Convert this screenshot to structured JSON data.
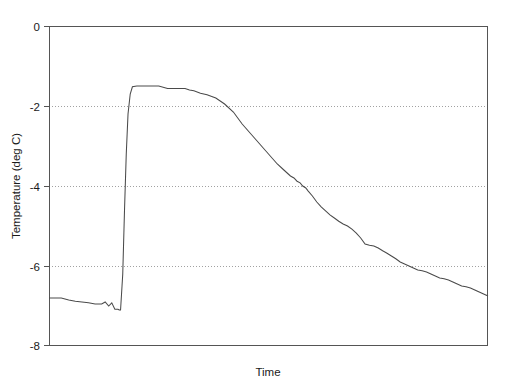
{
  "chart_data": {
    "type": "line",
    "title": "",
    "xlabel": "Time",
    "ylabel": "Temperature (deg C)",
    "ylim": [
      -8,
      0
    ],
    "yticks": [
      0,
      -2,
      -4,
      -6,
      -8
    ],
    "ytick_labels": [
      "0",
      "-2",
      "-4",
      "-6",
      "-8"
    ],
    "xticks": [],
    "xtick_labels": [],
    "grid": "horizontal-dotted-at--2--4--6",
    "legend": "none",
    "series": [
      {
        "name": "Temperature",
        "line_color": "#4a4a4a",
        "x": [
          0.0,
          0.028,
          0.045,
          0.06,
          0.075,
          0.09,
          0.105,
          0.12,
          0.128,
          0.136,
          0.143,
          0.15,
          0.157,
          0.16,
          0.163,
          0.168,
          0.172,
          0.176,
          0.18,
          0.185,
          0.19,
          0.2,
          0.21,
          0.23,
          0.25,
          0.27,
          0.29,
          0.31,
          0.32,
          0.33,
          0.345,
          0.36,
          0.38,
          0.4,
          0.42,
          0.44,
          0.46,
          0.48,
          0.5,
          0.52,
          0.535,
          0.55,
          0.558,
          0.565,
          0.572,
          0.578,
          0.585,
          0.59,
          0.6,
          0.61,
          0.62,
          0.63,
          0.64,
          0.65,
          0.66,
          0.67,
          0.68,
          0.69,
          0.7,
          0.71,
          0.72,
          0.73,
          0.74,
          0.75,
          0.76,
          0.77,
          0.78,
          0.79,
          0.8,
          0.81,
          0.82,
          0.83,
          0.84,
          0.85,
          0.86,
          0.87,
          0.88,
          0.89,
          0.9,
          0.91,
          0.92,
          0.93,
          0.94,
          0.95,
          0.96,
          0.97,
          0.98,
          0.99,
          1.0
        ],
        "y": [
          -6.8,
          -6.8,
          -6.85,
          -6.88,
          -6.9,
          -6.92,
          -6.95,
          -6.95,
          -6.9,
          -7.0,
          -6.92,
          -7.08,
          -7.08,
          -7.1,
          -7.1,
          -6.2,
          -4.6,
          -3.2,
          -2.2,
          -1.7,
          -1.52,
          -1.5,
          -1.5,
          -1.5,
          -1.5,
          -1.56,
          -1.56,
          -1.56,
          -1.6,
          -1.62,
          -1.68,
          -1.72,
          -1.8,
          -1.95,
          -2.15,
          -2.45,
          -2.7,
          -2.95,
          -3.2,
          -3.45,
          -3.6,
          -3.75,
          -3.8,
          -3.88,
          -3.92,
          -4.0,
          -4.05,
          -4.12,
          -4.25,
          -4.4,
          -4.52,
          -4.62,
          -4.72,
          -4.8,
          -4.88,
          -4.95,
          -5.0,
          -5.08,
          -5.18,
          -5.3,
          -5.45,
          -5.48,
          -5.5,
          -5.55,
          -5.62,
          -5.68,
          -5.75,
          -5.82,
          -5.9,
          -5.95,
          -6.0,
          -6.05,
          -6.1,
          -6.12,
          -6.15,
          -6.2,
          -6.25,
          -6.3,
          -6.32,
          -6.35,
          -6.4,
          -6.45,
          -6.5,
          -6.52,
          -6.55,
          -6.6,
          -6.65,
          -6.7,
          -6.75
        ]
      }
    ]
  }
}
